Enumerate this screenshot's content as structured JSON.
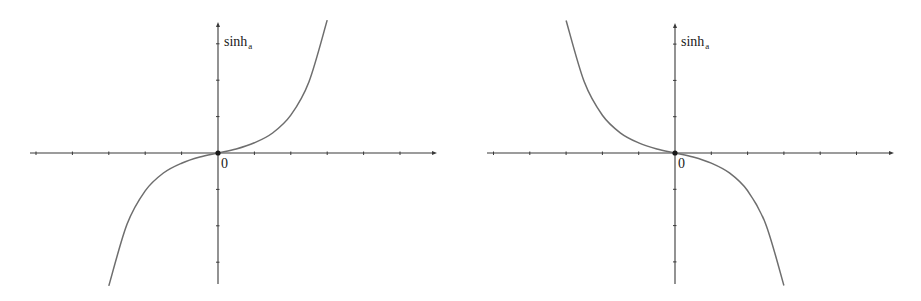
{
  "figure": {
    "panels": [
      {
        "id": "left",
        "function_label": "sinh",
        "function_subscript": "a",
        "origin_label": "0"
      },
      {
        "id": "right",
        "function_label": "sinh",
        "function_subscript": "a",
        "origin_label": "0"
      }
    ]
  },
  "chart_data": [
    {
      "type": "line",
      "title": "",
      "ylabel": "sinh_a",
      "xlabel": "",
      "origin_label": "0",
      "grid": false,
      "xlim": [
        -5.5,
        6
      ],
      "ylim": [
        -3.6,
        3.6
      ],
      "x_ticks": [
        -5,
        -4,
        -3,
        -2,
        -1,
        1,
        2,
        3,
        4,
        5
      ],
      "y_ticks": [
        -3,
        -2,
        -1,
        1,
        2,
        3
      ],
      "description": "Increasing odd function (base a > 1)",
      "series": [
        {
          "name": "sinh_a (a > 1)",
          "x": [
            -3.0,
            -2.5,
            -2.0,
            -1.5,
            -1.0,
            -0.5,
            0,
            0.5,
            1.0,
            1.5,
            2.0,
            2.5,
            3.0
          ],
          "y": [
            -3.65,
            -1.96,
            -1.04,
            -0.55,
            -0.28,
            -0.11,
            0,
            0.11,
            0.28,
            0.55,
            1.04,
            1.96,
            3.65
          ]
        }
      ],
      "geometry": {
        "origin_px": [
          218,
          153
        ],
        "unit_px": 36.4,
        "x_axis_px": [
          30,
          437
        ],
        "y_axis_px": [
          22,
          284
        ]
      }
    },
    {
      "type": "line",
      "title": "",
      "ylabel": "sinh_a",
      "xlabel": "",
      "origin_label": "0",
      "grid": false,
      "xlim": [
        -5.3,
        6
      ],
      "ylim": [
        -3.6,
        3.6
      ],
      "x_ticks": [
        -5,
        -4,
        -3,
        -2,
        -1,
        1,
        2,
        3,
        4,
        5
      ],
      "y_ticks": [
        -3,
        -2,
        -1,
        1,
        2,
        3
      ],
      "description": "Decreasing odd function (base 0 < a < 1)",
      "series": [
        {
          "name": "sinh_a (0 < a < 1)",
          "x": [
            -3.0,
            -2.5,
            -2.0,
            -1.5,
            -1.0,
            -0.5,
            0,
            0.5,
            1.0,
            1.5,
            2.0,
            2.5,
            3.0
          ],
          "y": [
            3.65,
            1.96,
            1.04,
            0.55,
            0.28,
            0.11,
            0,
            -0.11,
            -0.28,
            -0.55,
            -1.04,
            -1.96,
            -3.65
          ]
        }
      ],
      "geometry": {
        "origin_px": [
          675,
          153
        ],
        "unit_px": 36.3,
        "x_axis_px": [
          487,
          894
        ],
        "y_axis_px": [
          23,
          284
        ]
      }
    }
  ]
}
